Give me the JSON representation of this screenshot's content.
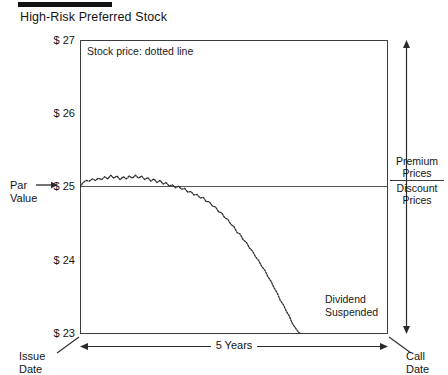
{
  "header": {
    "title": "High-Risk Preferred Stock",
    "rule_color": "#111111"
  },
  "legend": {
    "note": "Stock price: dotted line"
  },
  "annotations": {
    "dividend_line1": "Dividend",
    "dividend_line2": "Suspended"
  },
  "axis": {
    "y_ticks": [
      "$ 27",
      "$ 26",
      "$ 25",
      "$ 24",
      "$ 23"
    ],
    "par_value_line1": "Par",
    "par_value_line2": "Value",
    "x_span_label": "5 Years",
    "issue_date_line1": "Issue",
    "issue_date_line2": "Date",
    "call_date_line1": "Call",
    "call_date_line2": "Date"
  },
  "side": {
    "premium_line1": "Premium",
    "premium_line2": "Prices",
    "discount_line1": "Discount",
    "discount_line2": "Prices"
  },
  "chart_data": {
    "type": "line",
    "title": "High-Risk Preferred Stock",
    "xlabel": "5 Years",
    "ylabel": "",
    "ylim": [
      23,
      27
    ],
    "xlim": [
      0,
      5
    ],
    "yticks": [
      23,
      24,
      25,
      26,
      27
    ],
    "ytick_labels": [
      "$ 23",
      "$ 24",
      "$ 25",
      "$ 26",
      "$ 27"
    ],
    "grid": false,
    "legend": "Stock price: dotted line",
    "legend_position": "inside-top-left",
    "line_style": "dotted",
    "line_color": "#2b2b2b",
    "reference_lines": [
      {
        "name": "par-value",
        "y": 25,
        "label": "Par Value",
        "color": "#555555"
      }
    ],
    "annotations": [
      {
        "text": "Dividend Suspended",
        "x": 4.0,
        "y": 23.35
      }
    ],
    "series": [
      {
        "name": "Stock price",
        "x": [
          0.0,
          0.05,
          0.1,
          0.15,
          0.2,
          0.25,
          0.3,
          0.35,
          0.4,
          0.45,
          0.5,
          0.55,
          0.6,
          0.65,
          0.7,
          0.75,
          0.8,
          0.85,
          0.9,
          0.95,
          1.0,
          1.05,
          1.1,
          1.15,
          1.2,
          1.25,
          1.3,
          1.35,
          1.4,
          1.45,
          1.5,
          1.55,
          1.6,
          1.65,
          1.7,
          1.75,
          1.8,
          1.85,
          1.9,
          1.95,
          2.0,
          2.05,
          2.1,
          2.15,
          2.2,
          2.25,
          2.3,
          2.35,
          2.4,
          2.45,
          2.5,
          2.55,
          2.6,
          2.65,
          2.7,
          2.75,
          2.8,
          2.85,
          2.9,
          2.95,
          3.0,
          3.05,
          3.1,
          3.15,
          3.2,
          3.25,
          3.3,
          3.35,
          3.4,
          3.45,
          3.5,
          3.55,
          3.6
        ],
        "y": [
          25.0,
          25.06,
          25.09,
          25.08,
          25.11,
          25.09,
          25.12,
          25.1,
          25.14,
          25.11,
          25.16,
          25.12,
          25.15,
          25.1,
          25.14,
          25.11,
          25.15,
          25.12,
          25.16,
          25.12,
          25.15,
          25.1,
          25.13,
          25.08,
          25.11,
          25.06,
          25.09,
          25.04,
          25.06,
          25.01,
          25.03,
          24.99,
          25.01,
          24.97,
          24.98,
          24.93,
          24.94,
          24.89,
          24.9,
          24.85,
          24.86,
          24.8,
          24.8,
          24.74,
          24.73,
          24.66,
          24.65,
          24.58,
          24.56,
          24.49,
          24.46,
          24.38,
          24.36,
          24.28,
          24.25,
          24.17,
          24.13,
          24.05,
          24.0,
          23.92,
          23.87,
          23.78,
          23.72,
          23.63,
          23.56,
          23.46,
          23.4,
          23.31,
          23.24,
          23.14,
          23.08,
          23.02,
          23.0
        ]
      }
    ]
  }
}
